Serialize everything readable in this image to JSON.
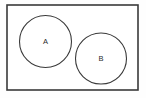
{
  "figure": {
    "type": "venn-diagram",
    "background_color": "#fefefe"
  },
  "universe": {
    "name": "universal-set-rectangle",
    "label": "",
    "x": 7,
    "y": 5,
    "width": 131,
    "height": 85,
    "stroke_color": "#3a3a3a",
    "stroke_width": 1.6,
    "fill_color": "#ffffff"
  },
  "sets": [
    {
      "id": "A",
      "label": "A",
      "cx": 45.5,
      "cy": 41.5,
      "r": 26,
      "stroke_color": "#3a3a3a",
      "stroke_width": 1.1,
      "fill_color": "none",
      "label_x": 45.5,
      "label_y": 41.0,
      "label_size": 7.5,
      "label_color": "#2b2b2b"
    },
    {
      "id": "B",
      "label": "B",
      "cx": 101,
      "cy": 58.5,
      "r": 25.5,
      "stroke_color": "#3a3a3a",
      "stroke_width": 1.1,
      "fill_color": "none",
      "label_x": 101,
      "label_y": 58.5,
      "label_size": 7.5,
      "label_color": "#2b2b2b"
    }
  ],
  "relationship": {
    "name": "disjoint",
    "description": "Circles A and B do not overlap"
  },
  "chart_data": {
    "type": "diagram",
    "categories": [
      "A",
      "B"
    ],
    "values": [
      1,
      1
    ],
    "annotations": [
      "A",
      "B"
    ],
    "xlabel": "",
    "ylabel": "",
    "legend": []
  }
}
